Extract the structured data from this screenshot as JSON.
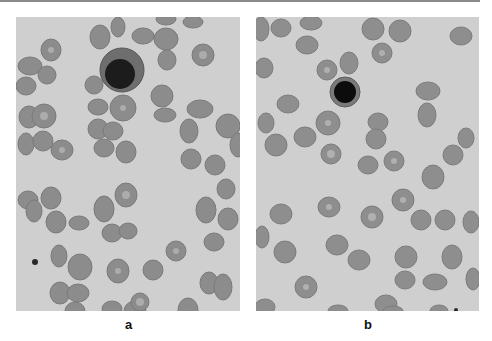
{
  "figure": {
    "panels": [
      {
        "label": "a",
        "background": "#cfcfcf",
        "nucleated_cell": {
          "cx": 106,
          "cy": 53,
          "r": 22,
          "nucleus_cx": 104,
          "nucleus_cy": 57,
          "nucleus_r": 15,
          "cytoplasm": "#6e6e6e",
          "nucleus": "#1c1c1c"
        },
        "rbc_color": "#8c8c8c",
        "rbc_center": "#b4b4b4"
      },
      {
        "label": "b",
        "background": "#cfcfcf",
        "nucleated_cell": {
          "cx": 89,
          "cy": 75,
          "r": 15,
          "nucleus_cx": 89,
          "nucleus_cy": 75,
          "nucleus_r": 11,
          "cytoplasm": "#7a7a7a",
          "nucleus": "#0c0c0c"
        },
        "rbc_color": "#8e8e8e",
        "rbc_center": "#b6b6b6"
      }
    ]
  }
}
